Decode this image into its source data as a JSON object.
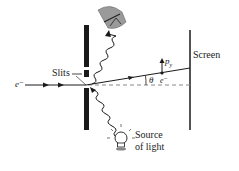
{
  "diagram": {
    "type": "physics-apparatus",
    "labels": {
      "slits": "Slits",
      "screen": "Screen",
      "source_line1": "Source",
      "source_line2": "of light",
      "electron_incoming": "e⁻",
      "electron_at_screen": "e⁻",
      "theta": "θ",
      "momentum_p": "p",
      "momentum_sub": "y"
    },
    "elements": [
      {
        "id": "slit-barrier",
        "description": "Vertical black barrier with two slits"
      },
      {
        "id": "screen",
        "description": "Vertical line on the right"
      },
      {
        "id": "electron-beam",
        "description": "Incoming electron path with arrows from left"
      },
      {
        "id": "deflected-path",
        "description": "Electron path deflected by angle theta toward screen"
      },
      {
        "id": "axis-dashed",
        "description": "Dashed horizontal reference line"
      },
      {
        "id": "photon-in",
        "description": "Wavy line from light bulb to slit"
      },
      {
        "id": "photon-out",
        "description": "Wavy scattered photon to detector/eye"
      },
      {
        "id": "detector",
        "description": "Observer eye/detector at top"
      },
      {
        "id": "light-bulb",
        "description": "Light source bulb at bottom"
      }
    ],
    "colors": {
      "ink": "#1a1a1a",
      "dashed": "#888888",
      "detector_fill": "#9a9a9a"
    }
  }
}
